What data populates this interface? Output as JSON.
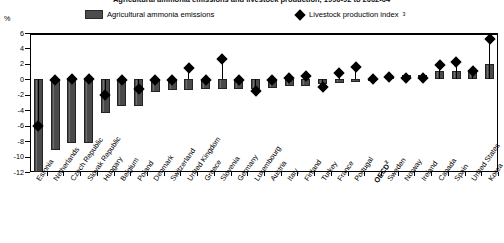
{
  "title": "Agricultural ammonia emissions and livestock production, 1990-92 to 2002-04",
  "axis_unit": "%",
  "legend": [
    {
      "label": "Agricultural ammonia emissions",
      "icon": "bar-swatch",
      "color": "#4d4d4d"
    },
    {
      "label": "Livestock production index",
      "icon": "diamond-swatch",
      "color": "#000000",
      "note": "3"
    }
  ],
  "yaxis": {
    "ticks": [
      6,
      4,
      2,
      0,
      -2,
      -4,
      -6,
      -8,
      -10,
      -12
    ],
    "min": -12,
    "max": 6
  },
  "chart_data": {
    "type": "bar",
    "title": "Agricultural ammonia emissions and livestock production, 1990-92 to 2002-04",
    "xlabel": "",
    "ylabel": "%",
    "ylim": [
      -12,
      6
    ],
    "grid": false,
    "legend_position": "top",
    "categories": [
      "Estonia",
      "Netherlands",
      "Czech Republic",
      "Slovak Republic",
      "Hungary",
      "Belgium",
      "Poland",
      "Denmark",
      "Switzerland",
      "United Kingdom",
      "Greece",
      "Slovenia",
      "Germany",
      "Luxembourg",
      "Austria",
      "Italy",
      "Finland",
      "Turkey",
      "France",
      "Portugal",
      "OECD",
      "Sweden",
      "Norway",
      "Ireland",
      "Canada",
      "Spain",
      "United States",
      "Korea"
    ],
    "series": [
      {
        "name": "Agricultural ammonia emissions",
        "type": "bar",
        "values": [
          -12.0,
          -9.2,
          -8.2,
          -8.2,
          -4.3,
          -3.5,
          -3.4,
          -1.6,
          -1.4,
          -1.4,
          -1.3,
          -1.3,
          -1.2,
          -1.2,
          -1.1,
          -0.9,
          -0.8,
          -0.6,
          -0.5,
          -0.4,
          -0.2,
          0.4,
          0.5,
          0.6,
          1.1,
          1.1,
          1.2,
          2.0
        ]
      },
      {
        "name": "Livestock production index",
        "type": "scatter",
        "marker": "diamond",
        "values": [
          -6.1,
          -0.1,
          0.1,
          0.1,
          -2.0,
          -0.1,
          -1.2,
          -0.1,
          -0.1,
          1.5,
          -0.1,
          2.6,
          -0.1,
          -1.5,
          -0.1,
          0.2,
          0.4,
          -1.0,
          0.8,
          1.6,
          0.0,
          0.3,
          0.2,
          0.2,
          1.8,
          2.3,
          1.1,
          5.2
        ]
      }
    ]
  }
}
